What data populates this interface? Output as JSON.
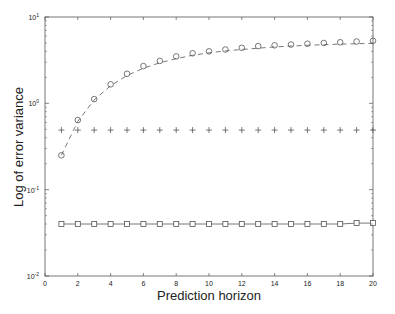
{
  "chart_data": {
    "type": "line",
    "title": "",
    "xlabel": "Prediction horizon",
    "ylabel": "Log of error variance",
    "yscale": "log",
    "xlim": [
      0,
      20
    ],
    "ylim": [
      0.01,
      10
    ],
    "xticks": [
      0,
      2,
      4,
      6,
      8,
      10,
      12,
      14,
      16,
      18,
      20
    ],
    "yticks": [
      {
        "value": 10,
        "base": "10",
        "exp": "1"
      },
      {
        "value": 1,
        "base": "10",
        "exp": "0"
      },
      {
        "value": 0.1,
        "base": "10",
        "exp": "-1"
      },
      {
        "value": 0.01,
        "base": "10",
        "exp": "-2"
      }
    ],
    "grid": false,
    "legend": null,
    "x": [
      1,
      2,
      3,
      4,
      5,
      6,
      7,
      8,
      9,
      10,
      11,
      12,
      13,
      14,
      15,
      16,
      17,
      18,
      19,
      20
    ],
    "series": [
      {
        "name": "circles",
        "marker": "o",
        "linestyle": "none",
        "values": [
          0.25,
          0.64,
          1.12,
          1.66,
          2.2,
          2.7,
          3.1,
          3.5,
          3.8,
          4.0,
          4.2,
          4.4,
          4.6,
          4.7,
          4.8,
          4.9,
          5.0,
          5.1,
          5.2,
          5.3
        ]
      },
      {
        "name": "dashed fit",
        "marker": "none",
        "linestyle": "dashed",
        "values": [
          0.25,
          0.62,
          1.1,
          1.6,
          2.1,
          2.55,
          2.95,
          3.3,
          3.6,
          3.85,
          4.05,
          4.2,
          4.35,
          4.5,
          4.6,
          4.7,
          4.78,
          4.85,
          4.9,
          4.95
        ]
      },
      {
        "name": "plus",
        "marker": "+",
        "linestyle": "none",
        "values": [
          0.49,
          0.49,
          0.49,
          0.49,
          0.49,
          0.49,
          0.49,
          0.49,
          0.49,
          0.49,
          0.49,
          0.49,
          0.49,
          0.49,
          0.49,
          0.49,
          0.49,
          0.49,
          0.49,
          0.49
        ]
      },
      {
        "name": "squares",
        "marker": "s",
        "linestyle": "solid",
        "values": [
          0.04,
          0.04,
          0.04,
          0.04,
          0.04,
          0.04,
          0.04,
          0.04,
          0.04,
          0.04,
          0.04,
          0.04,
          0.04,
          0.04,
          0.04,
          0.04,
          0.04,
          0.04,
          0.041,
          0.041
        ]
      }
    ]
  },
  "colors": {
    "axis": "#555555",
    "markers": "#555555",
    "text": "#222222",
    "background": "#ffffff"
  }
}
